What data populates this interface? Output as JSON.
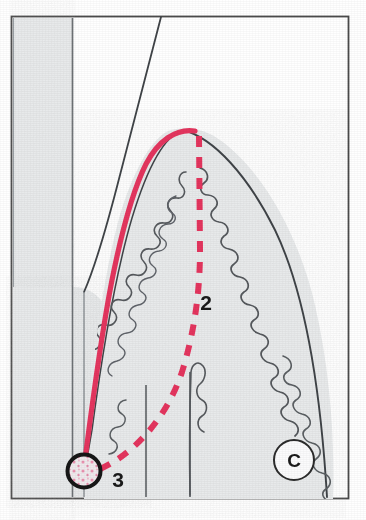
{
  "figure": {
    "kind": "anatomical-histology-line-drawing",
    "frame": {
      "visible": true,
      "stroke_color": "#4a4a4a",
      "left": 11,
      "top": 16,
      "right": 349,
      "bottom": 499
    },
    "background_color": "#ffffff",
    "tissue_fill_color": "#e9ebec",
    "outline_color": "#3f4347",
    "highlight_color": "#e4355e",
    "label_color": "#1a1a1a"
  },
  "labels": [
    {
      "id": "label-2",
      "text": "2",
      "x": 206,
      "y": 310,
      "describes": "dashed crimson line running from cusp apex to cervical marker"
    },
    {
      "id": "label-3",
      "text": "3",
      "x": 113,
      "y": 487,
      "describes": "circled cervical loop marker at base of solid crimson curve"
    },
    {
      "id": "label-c",
      "text": "C",
      "x": 295,
      "y": 467,
      "describes": "circled region label C on right flank"
    }
  ],
  "markers": {
    "cervical_circle": {
      "name": "circled-marker-3",
      "cx": 84,
      "cy": 471,
      "r": 17,
      "stroke_color": "#161616",
      "stroke_width": 4,
      "fill_color": "#efe7ea",
      "speckle_color": "#e8749a"
    },
    "c_circle": {
      "name": "circled-marker-c",
      "cx": 294,
      "cy": 460,
      "r": 20,
      "stroke_color": "#2b2b2b",
      "stroke_width": 2,
      "fill_color": "#fbfbfc"
    }
  },
  "curves": {
    "solid_highlight": {
      "name": "solid-crimson-curve",
      "color": "#e4355e",
      "width": 5,
      "dashed": false,
      "description": "traces outer enamel surface from cusp apex down left flank to cervical circle"
    },
    "dashed_highlight": {
      "name": "dashed-crimson-line",
      "color": "#e4355e",
      "width": 6,
      "dashed": true,
      "dash_pattern": "11 10",
      "description": "runs from cusp apex vertically then obliquely to cervical circle"
    },
    "left_band": {
      "name": "left-vertical-tissue-band",
      "fill": "#e9ebec",
      "stroke": "#6e7276",
      "x_left": 13,
      "x_right": 72
    }
  }
}
